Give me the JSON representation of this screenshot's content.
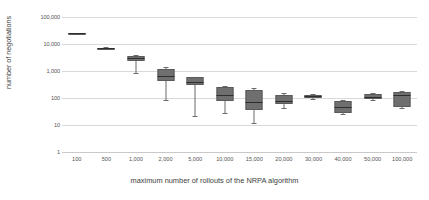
{
  "chart_data": {
    "type": "box",
    "title": "",
    "xlabel": "maximum number of rollouts of the NRPA algorithm",
    "ylabel": "number of negotiations",
    "yscale": "log",
    "ylim": [
      1,
      100000
    ],
    "ytick_labels": [
      "100,000",
      "10,000",
      "1,000",
      "100",
      "10",
      "1"
    ],
    "ytick_values": [
      100000,
      10000,
      1000,
      100,
      10,
      1
    ],
    "grid": true,
    "legend": "none",
    "categories": [
      "100",
      "500",
      "1,000",
      "2,000",
      "5,000",
      "10,000",
      "15,000",
      "20,000",
      "30,000",
      "40,000",
      "50,000",
      "100,000"
    ],
    "boxes": [
      {
        "category": "100",
        "whisker_low": 23000,
        "q1": 23500,
        "median": 25000,
        "q3": 26000,
        "whisker_high": 26500
      },
      {
        "category": "500",
        "whisker_low": 6500,
        "q1": 6700,
        "median": 7000,
        "q3": 7400,
        "whisker_high": 7700
      },
      {
        "category": "1,000",
        "whisker_low": 820,
        "q1": 2400,
        "median": 3000,
        "q3": 3700,
        "whisker_high": 3900
      },
      {
        "category": "2,000",
        "whisker_low": 82,
        "q1": 420,
        "median": 680,
        "q3": 1150,
        "whisker_high": 1400
      },
      {
        "category": "5,000",
        "whisker_low": 21,
        "q1": 300,
        "median": 380,
        "q3": 590,
        "whisker_high": 620
      },
      {
        "category": "10,000",
        "whisker_low": 27,
        "q1": 75,
        "median": 125,
        "q3": 260,
        "whisker_high": 290
      },
      {
        "category": "15,000",
        "whisker_low": 12,
        "q1": 35,
        "median": 70,
        "q3": 200,
        "whisker_high": 230
      },
      {
        "category": "20,000",
        "whisker_low": 42,
        "q1": 58,
        "median": 80,
        "q3": 130,
        "whisker_high": 150
      },
      {
        "category": "30,000",
        "whisker_low": 95,
        "q1": 103,
        "median": 115,
        "q3": 128,
        "whisker_high": 135
      },
      {
        "category": "40,000",
        "whisker_low": 25,
        "q1": 28,
        "median": 45,
        "q3": 80,
        "whisker_high": 85
      },
      {
        "category": "50,000",
        "whisker_low": 85,
        "q1": 90,
        "median": 110,
        "q3": 145,
        "whisker_high": 150
      },
      {
        "category": "100,000",
        "whisker_low": 42,
        "q1": 45,
        "median": 125,
        "q3": 170,
        "whisker_high": 175
      }
    ],
    "colors": {
      "box_fill": "#6f6f6f",
      "box_border": "#5a5a5a",
      "median": "#2e2e2e",
      "whisker": "#6b6b6b",
      "gridline": "#d9d9d9",
      "background": "#ffffff",
      "text": "#3d3d3d"
    }
  }
}
